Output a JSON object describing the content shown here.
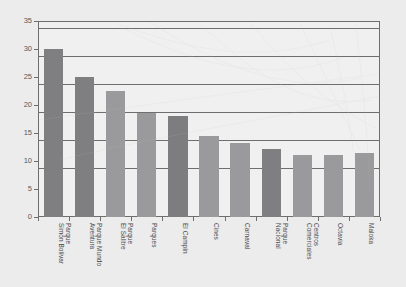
{
  "chart_data": {
    "type": "bar",
    "title": "",
    "xlabel": "",
    "ylabel": "",
    "ylim": [
      0,
      35
    ],
    "ytick_step": 5,
    "yticks": [
      "0",
      "5",
      "10",
      "15",
      "20",
      "25",
      "30",
      "35"
    ],
    "grid": true,
    "legend": "none",
    "categories": [
      "Parque\nSimón Bolívar",
      "Parque Mundo\nAventura",
      "Parque\nEl Salitre",
      "Parques",
      "El Campín",
      "Cines",
      "Carnaval",
      "Parque\nNacional",
      "Centros\nComerciales",
      "Octavia",
      "Maloka"
    ],
    "category_lines": [
      [
        "Parque",
        "Simón Bolívar"
      ],
      [
        "Parque Mundo",
        "Aventura"
      ],
      [
        "Parque",
        "El Salitre"
      ],
      [
        "Parques"
      ],
      [
        "El Campín"
      ],
      [
        "Cines"
      ],
      [
        "Carnaval"
      ],
      [
        "Parque",
        "Nacional"
      ],
      [
        "Centros",
        "Comerciales"
      ],
      [
        "Octavia"
      ],
      [
        "Maloka"
      ]
    ],
    "values": [
      30,
      25,
      22.5,
      18.5,
      18,
      14.5,
      13.2,
      12.2,
      11,
      11,
      11.4
    ],
    "bar_colors": [
      "#7f7f81",
      "#7f7f81",
      "#9a9a9c",
      "#9a9a9c",
      "#7d7d7f",
      "#9a9a9c",
      "#9a9a9c",
      "#7f7f81",
      "#9a9a9c",
      "#9a9a9c",
      "#9a9a9c"
    ],
    "colors": {
      "background": "#ececed",
      "plot_background": "#f0f0f0",
      "axis": "#6e6e6e",
      "grid": "#6e6e6e",
      "tick_text": "#58585a",
      "label_text": "#4a4a4c",
      "bar_dark": "#7f7f81",
      "bar_light": "#9a9a9c"
    }
  }
}
